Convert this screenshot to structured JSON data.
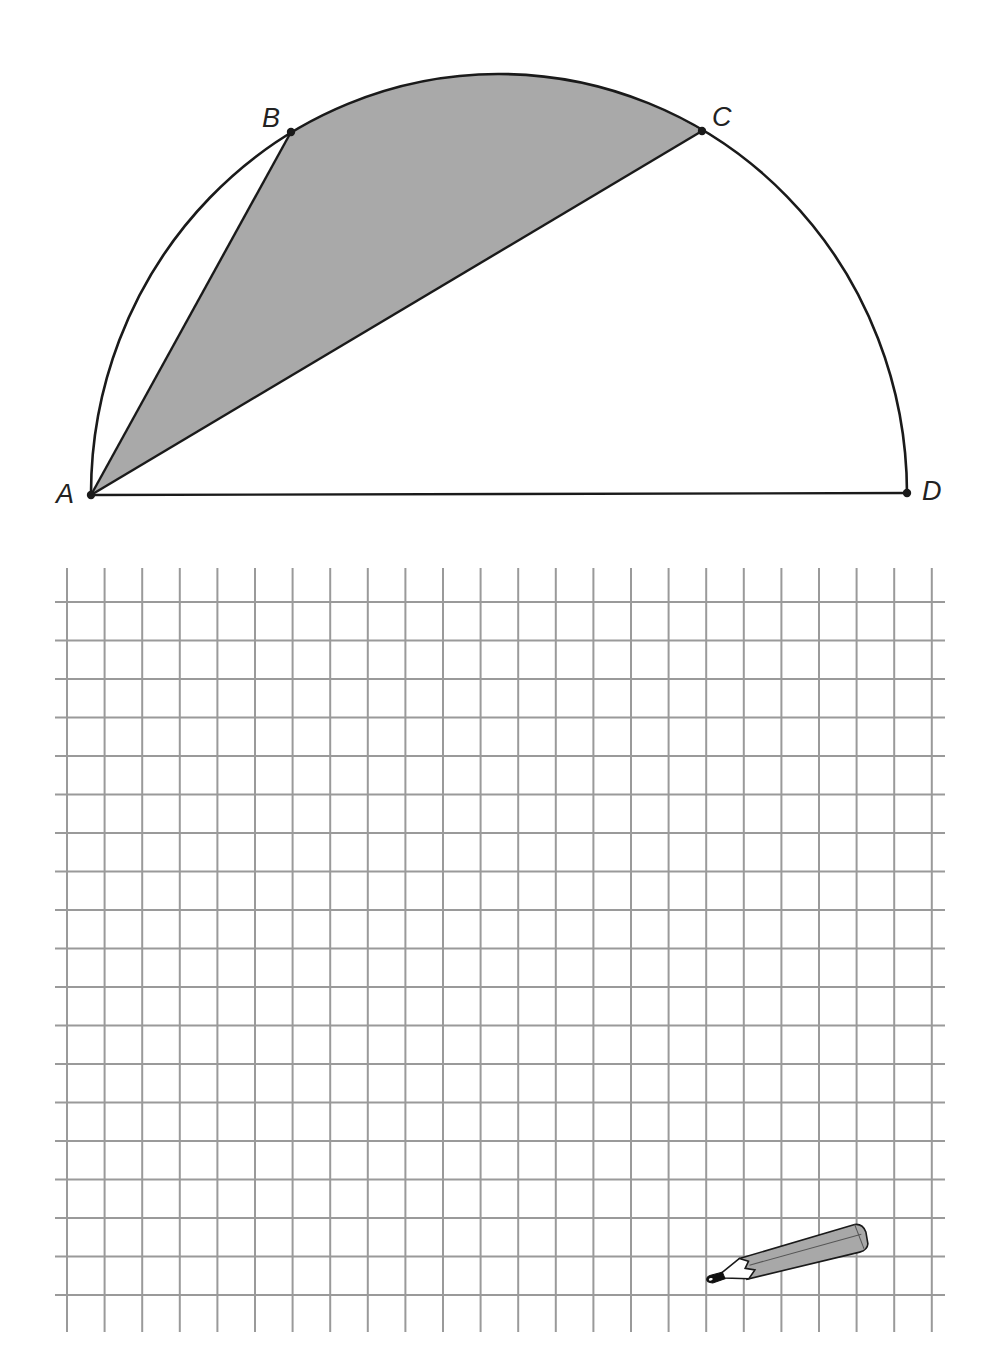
{
  "figure": {
    "type": "semicircle-inscribed-quadrilateral",
    "shaded_region": "Region bounded by chord AB, arc BC and chord CA",
    "colors": {
      "stroke": "#1a1a1a",
      "shade": "#a9a9a9",
      "grid": "#9a9a9a",
      "background": "#ffffff"
    },
    "semicircle": {
      "cx": 499,
      "cy": 494,
      "rx": 408,
      "ry": 420
    },
    "points": [
      {
        "name": "A",
        "label": "A",
        "x": 91,
        "y": 495,
        "lx": 56,
        "ly": 503
      },
      {
        "name": "B",
        "label": "B",
        "x": 291,
        "y": 132,
        "lx": 262,
        "ly": 127
      },
      {
        "name": "C",
        "label": "C",
        "x": 702,
        "y": 131,
        "lx": 712,
        "ly": 126
      },
      {
        "name": "D",
        "label": "D",
        "x": 907,
        "y": 493,
        "lx": 922,
        "ly": 500
      }
    ],
    "segments": [
      {
        "from": "A",
        "to": "D"
      },
      {
        "from": "A",
        "to": "B"
      },
      {
        "from": "A",
        "to": "C"
      }
    ]
  },
  "grid": {
    "vertical": {
      "count": 24,
      "x_start": 67,
      "spacing": 37.6,
      "y_top": 568,
      "y_bottom": 1332
    },
    "horizontal": {
      "count": 19,
      "y_start": 602,
      "spacing": 38.5,
      "x_left": 55,
      "x_right": 945
    }
  },
  "decorations": {
    "pencil": {
      "icon": "pencil-icon",
      "tip_x": 712,
      "tip_y": 1280,
      "end_x": 868,
      "end_y": 1240
    }
  }
}
